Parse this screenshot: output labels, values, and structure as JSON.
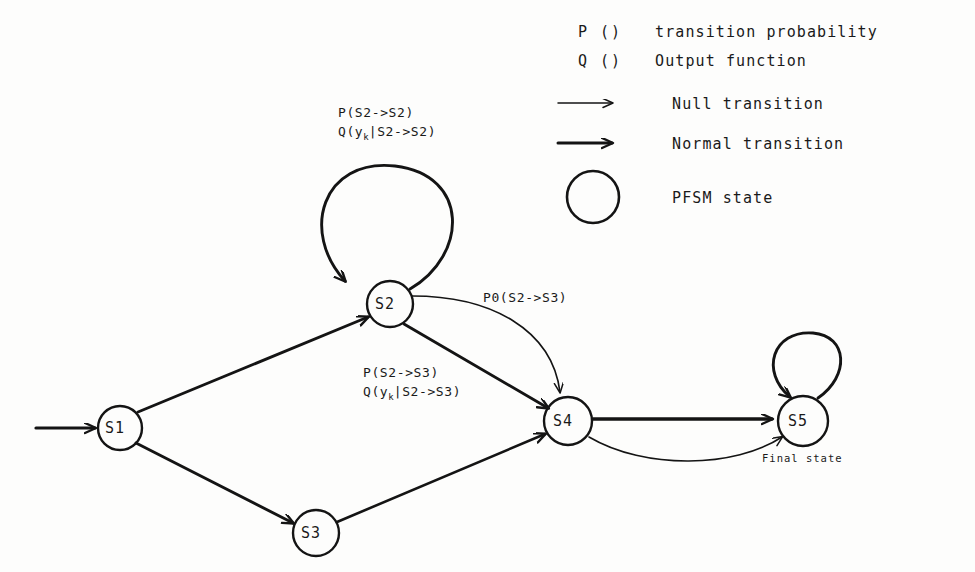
{
  "legend": {
    "rows": [
      {
        "symbol": "P ()",
        "label": "transition probability",
        "kind": "text"
      },
      {
        "symbol": "Q ()",
        "label": "Output function",
        "kind": "text"
      },
      {
        "symbol": "thin-arrow",
        "label": "Null transition",
        "kind": "arrow-thin"
      },
      {
        "symbol": "thick-arrow",
        "label": "Normal transition",
        "kind": "arrow-thick"
      },
      {
        "symbol": "circle",
        "label": "PFSM state",
        "kind": "circle"
      }
    ]
  },
  "states": [
    {
      "id": "S1",
      "label": "S1",
      "cx": 120,
      "cy": 428,
      "r": 22
    },
    {
      "id": "S2",
      "label": "S2",
      "cx": 390,
      "cy": 304,
      "r": 23
    },
    {
      "id": "S3",
      "label": "S3",
      "cx": 316,
      "cy": 533,
      "r": 23
    },
    {
      "id": "S4",
      "label": "S4",
      "cx": 568,
      "cy": 421,
      "r": 24
    },
    {
      "id": "S5",
      "label": "S5",
      "cx": 803,
      "cy": 421,
      "r": 25
    }
  ],
  "annotations": {
    "s5_final": "Final state",
    "s2_self_line1": "P(S2->S2)",
    "s2_self_line2_pre": "Q(y",
    "s2_self_line2_sub": "k",
    "s2_self_line2_post": "|S2->S2)",
    "s2_s4_line1": "P(S2->S3)",
    "s2_s4_line2_pre": "Q(y",
    "s2_s4_line2_sub": "k",
    "s2_s4_line2_post": "|S2->S3)",
    "s2_s4_null": "P0(S2->S3)"
  },
  "transitions": [
    {
      "from": "start",
      "to": "S1",
      "kind": "normal"
    },
    {
      "from": "S1",
      "to": "S2",
      "kind": "normal"
    },
    {
      "from": "S1",
      "to": "S3",
      "kind": "normal"
    },
    {
      "from": "S2",
      "to": "S2",
      "kind": "normal",
      "self_loop": true
    },
    {
      "from": "S2",
      "to": "S4",
      "kind": "normal"
    },
    {
      "from": "S2",
      "to": "S4",
      "kind": "null",
      "curved": true
    },
    {
      "from": "S3",
      "to": "S4",
      "kind": "normal"
    },
    {
      "from": "S4",
      "to": "S5",
      "kind": "normal"
    },
    {
      "from": "S4",
      "to": "S5",
      "kind": "null",
      "curved": true
    },
    {
      "from": "S5",
      "to": "S5",
      "kind": "normal",
      "self_loop": true
    }
  ],
  "style": {
    "ink": "#141414",
    "paper": "#fdfdfc"
  }
}
